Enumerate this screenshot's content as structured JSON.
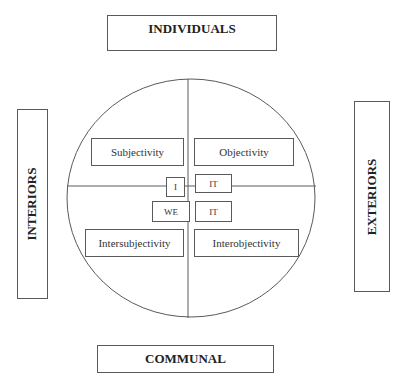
{
  "diagram": {
    "outer_labels": {
      "top": "INDIVIDUALS",
      "bottom": "COMMUNAL",
      "left": "INTERIORS",
      "right": "EXTERIORS"
    },
    "quadrants": {
      "upper_left": "Subjectivity",
      "upper_right": "Objectivity",
      "lower_left": "Intersubjectivity",
      "lower_right": "Interobjectivity"
    },
    "pronouns": {
      "upper_left": "I",
      "upper_right": "IT",
      "lower_left": "WE",
      "lower_right": "IT"
    },
    "colors": {
      "line": "#5a5a5a",
      "text": "#2a2a2a",
      "background": "#ffffff"
    }
  }
}
